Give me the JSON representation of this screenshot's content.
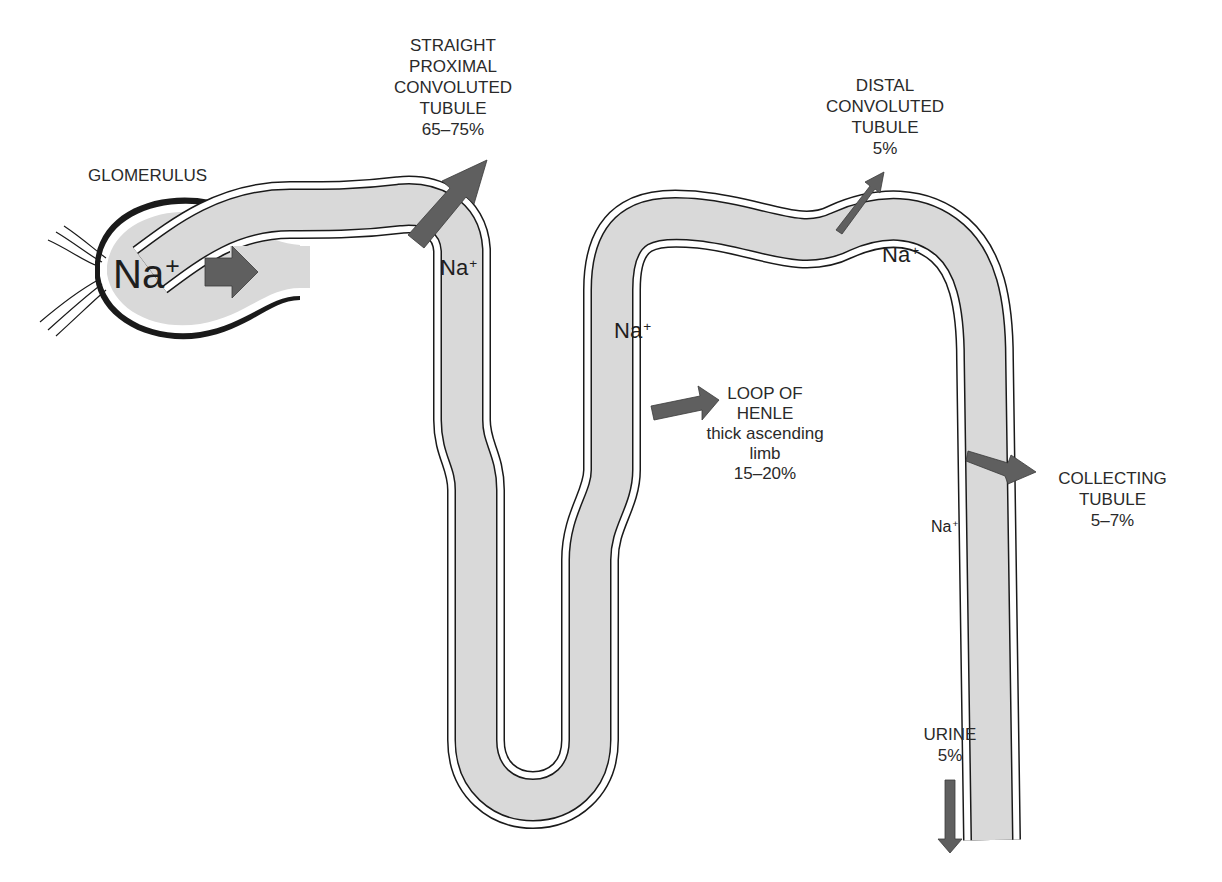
{
  "figure": {
    "colors": {
      "lumen": "#d9d9d9",
      "wall": "#ffffff",
      "outline": "#1a1a1a",
      "arrow": "#5f5f5f",
      "text": "#2a2a2a"
    }
  },
  "segments": {
    "glomerulus": {
      "label": "GLOMERULUS"
    },
    "proximal": {
      "lines": [
        "STRAIGHT",
        "PROXIMAL",
        "CONVOLUTED",
        "TUBULE",
        "65–75%"
      ]
    },
    "distal": {
      "lines": [
        "DISTAL",
        "CONVOLUTED",
        "TUBULE",
        "5%"
      ]
    },
    "loop": {
      "lines": [
        "LOOP OF",
        "HENLE",
        "thick ascending",
        "limb",
        "15–20%"
      ]
    },
    "collecting": {
      "lines": [
        "COLLECTING",
        "TUBULE",
        "5–7%"
      ]
    },
    "urine": {
      "lines": [
        "URINE",
        "5%"
      ]
    }
  },
  "ions": {
    "symbol": "Na",
    "charge": "+",
    "locations": [
      "glomerulus",
      "proximal",
      "loop-ascending",
      "distal",
      "collecting"
    ]
  }
}
